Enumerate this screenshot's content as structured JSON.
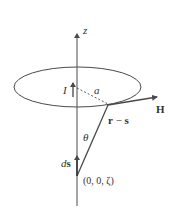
{
  "diagram": {
    "title": "",
    "colors": {
      "stroke": "#4a4a4a",
      "text": "#333333",
      "background": "#ffffff"
    },
    "labels": {
      "z_axis": "z",
      "current": "I",
      "radius": "a",
      "field": "H",
      "separation": "r − s",
      "angle": "θ",
      "element": "ds",
      "d_part": "d",
      "s_part": "s",
      "point": "(0, 0, ζ)",
      "r_part": "r",
      "minus": " − ",
      "s_sep_part": "s"
    },
    "elements": [
      {
        "type": "axis",
        "name": "z-axis",
        "direction": "vertical"
      },
      {
        "type": "ellipse",
        "name": "current-loop",
        "represents": "circular loop of radius a"
      },
      {
        "type": "arrow",
        "name": "current-arrow",
        "label": "I"
      },
      {
        "type": "dashed-line",
        "name": "radius-line",
        "label": "a"
      },
      {
        "type": "arrow",
        "name": "field-vector",
        "label": "H"
      },
      {
        "type": "line",
        "name": "separation-vector",
        "label": "r − s"
      },
      {
        "type": "angle",
        "name": "theta-angle",
        "label": "θ"
      },
      {
        "type": "arrow",
        "name": "ds-arrow",
        "label": "ds"
      },
      {
        "type": "point",
        "name": "source-point",
        "label": "(0, 0, ζ)"
      }
    ]
  }
}
